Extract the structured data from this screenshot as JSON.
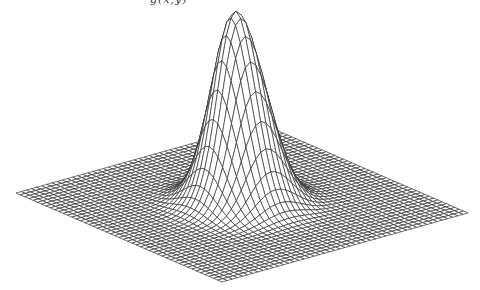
{
  "figure": {
    "title_fragment": "g(x,y)",
    "colors": {
      "background": "#ffffff",
      "line": "#2a2a2a"
    },
    "projection": {
      "corner_left": [
        16,
        193
      ],
      "corner_right": [
        468,
        213
      ],
      "corner_front": [
        222,
        282
      ],
      "corner_back": [
        262,
        124
      ],
      "peak_apex": [
        236,
        11
      ],
      "peak_height_px": 192
    },
    "surface": {
      "function": "gaussian",
      "grid_divisions": 48,
      "sigma_fraction": 0.085,
      "peak_amplitude": 1.0
    }
  }
}
